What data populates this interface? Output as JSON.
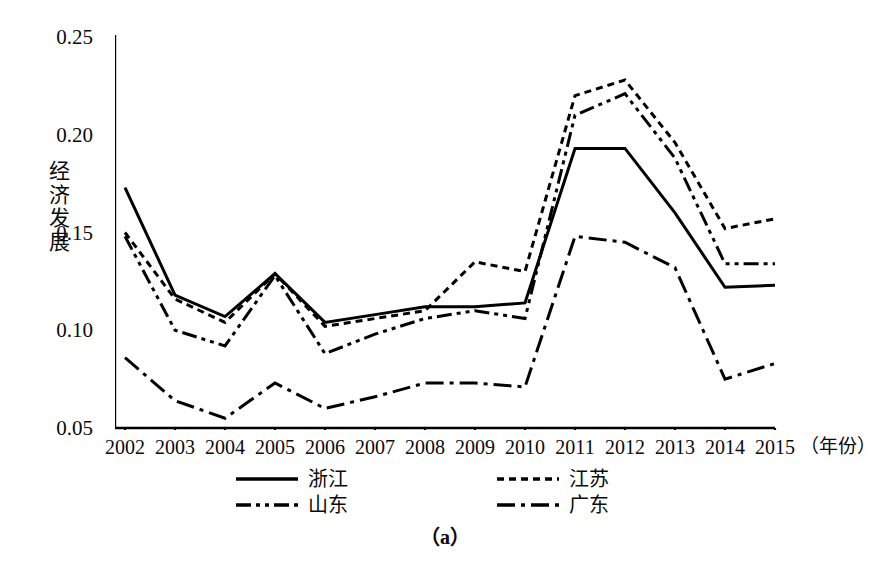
{
  "axis": {
    "y_title": "经济发展",
    "y_title_chars": [
      "经",
      "济",
      "发",
      "展"
    ],
    "x_title": "（年份）",
    "y_ticks": [
      "0.05",
      "0.10",
      "0.15",
      "0.20",
      "0.25"
    ],
    "x_ticks": [
      "2002",
      "2003",
      "2004",
      "2005",
      "2006",
      "2007",
      "2008",
      "2009",
      "2010",
      "2011",
      "2012",
      "2013",
      "2014",
      "2015"
    ]
  },
  "legend": {
    "items": [
      {
        "label": "浙江",
        "style": "solid"
      },
      {
        "label": "江苏",
        "style": "dotted"
      },
      {
        "label": "山东",
        "style": "dash-dot-dot"
      },
      {
        "label": "广东",
        "style": "dash-dot"
      }
    ]
  },
  "caption": "（a）",
  "colors": {
    "line": "#000000",
    "axis": "#000000",
    "background": "#ffffff"
  },
  "chart_data": {
    "type": "line",
    "title": "",
    "subtitle": "",
    "xlabel": "（年份）",
    "ylabel": "经济发展",
    "categories": [
      "2002",
      "2003",
      "2004",
      "2005",
      "2006",
      "2007",
      "2008",
      "2009",
      "2010",
      "2011",
      "2012",
      "2013",
      "2014",
      "2015"
    ],
    "x": [
      2002,
      2003,
      2004,
      2005,
      2006,
      2007,
      2008,
      2009,
      2010,
      2011,
      2012,
      2013,
      2014,
      2015
    ],
    "ylim": [
      0.04,
      0.26
    ],
    "xlim": [
      2002,
      2015
    ],
    "yticks": [
      0.05,
      0.1,
      0.15,
      0.2,
      0.25
    ],
    "grid": false,
    "legend_position": "bottom",
    "series": [
      {
        "name": "浙江",
        "style": "solid",
        "values": [
          0.173,
          0.118,
          0.107,
          0.129,
          0.104,
          0.108,
          0.112,
          0.112,
          0.114,
          0.193,
          0.193,
          0.16,
          0.122,
          0.123
        ]
      },
      {
        "name": "江苏",
        "style": "dotted",
        "values": [
          0.15,
          0.116,
          0.104,
          0.129,
          0.102,
          0.106,
          0.11,
          0.135,
          0.13,
          0.22,
          0.228,
          0.196,
          0.152,
          0.157
        ]
      },
      {
        "name": "山东",
        "style": "dash-dot-dot",
        "values": [
          0.148,
          0.1,
          0.092,
          0.128,
          0.088,
          0.098,
          0.106,
          0.11,
          0.106,
          0.21,
          0.221,
          0.188,
          0.134,
          0.134
        ]
      },
      {
        "name": "广东",
        "style": "dash-dot",
        "values": [
          0.086,
          0.064,
          0.055,
          0.073,
          0.06,
          0.066,
          0.073,
          0.073,
          0.071,
          0.148,
          0.145,
          0.132,
          0.075,
          0.083
        ]
      }
    ]
  }
}
